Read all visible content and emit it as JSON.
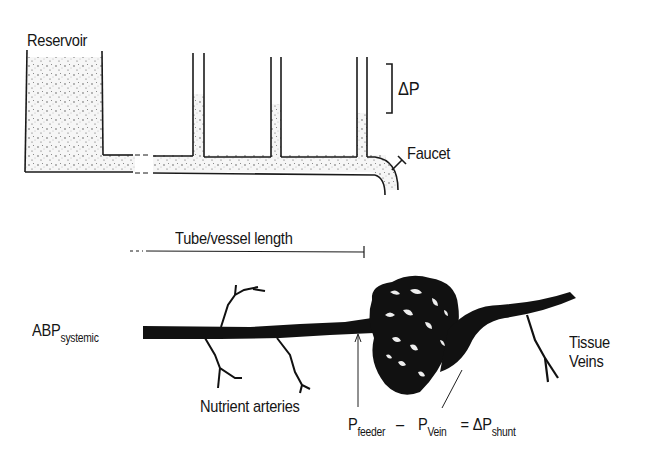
{
  "top_diagram": {
    "reservoir_label": "Reservoir",
    "delta_p_label": "ΔP",
    "faucet_label": "Faucet"
  },
  "length_axis": {
    "label": "Tube/vessel length"
  },
  "bottom_diagram": {
    "abp_main": "ABP",
    "abp_sub": "systemic",
    "nutrient_label": "Nutrient arteries",
    "tissue_label_line1": "Tissue",
    "tissue_label_line2": "Veins"
  },
  "equation": {
    "p1_main": "P",
    "p1_sub": "feeder",
    "minus": "–",
    "p2_main": "P",
    "p2_sub": "Vein",
    "equals": "= ΔP",
    "result_sub": "shunt"
  },
  "colors": {
    "ink": "#151515",
    "fluid_fill": "#f4f4f4",
    "background": "#ffffff"
  }
}
